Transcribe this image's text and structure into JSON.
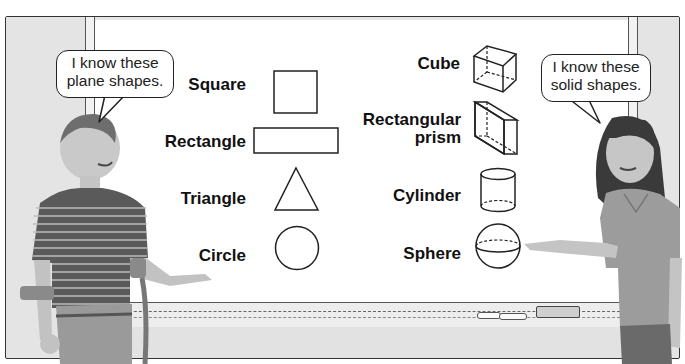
{
  "scene": {
    "description": "Two children presenting plane and solid shapes drawn on a whiteboard",
    "colors": {
      "wall": "#e4e4e4",
      "board": "#ffffff",
      "outline": "#222222",
      "label_text": "#111111"
    }
  },
  "bubbles": {
    "left": {
      "line1": "I know these",
      "line2": "plane shapes."
    },
    "right": {
      "line1": "I know these",
      "line2": "solid shapes."
    }
  },
  "plane_shapes": [
    {
      "label": "Square",
      "icon": "square-icon"
    },
    {
      "label": "Rectangle",
      "icon": "rectangle-icon"
    },
    {
      "label": "Triangle",
      "icon": "triangle-icon"
    },
    {
      "label": "Circle",
      "icon": "circle-icon"
    }
  ],
  "solid_shapes": [
    {
      "label": "Cube",
      "icon": "cube-icon"
    },
    {
      "label_line1": "Rectangular",
      "label_line2": "prism",
      "icon": "rectangular-prism-icon"
    },
    {
      "label": "Cylinder",
      "icon": "cylinder-icon"
    },
    {
      "label": "Sphere",
      "icon": "sphere-icon"
    }
  ]
}
